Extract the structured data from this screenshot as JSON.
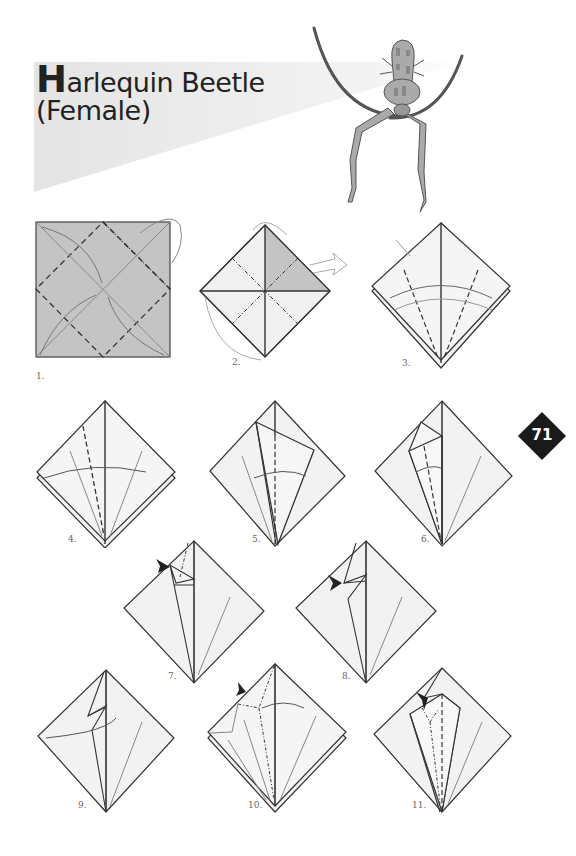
{
  "page": {
    "title_initial": "H",
    "title_rest": "arlequin Beetle",
    "subtitle": "(Female)",
    "page_number": "71"
  },
  "steps": [
    {
      "number": "1.",
      "label": "1."
    },
    {
      "number": "2.",
      "label": "2."
    },
    {
      "number": "3.",
      "label": "3."
    },
    {
      "number": "4.",
      "label": "4."
    },
    {
      "number": "5.",
      "label": "5."
    },
    {
      "number": "6.",
      "label": "6."
    },
    {
      "number": "7.",
      "label": "7."
    },
    {
      "number": "8.",
      "label": "8."
    },
    {
      "number": "9.",
      "label": "9."
    },
    {
      "number": "10.",
      "label": "10."
    },
    {
      "number": "11.",
      "label": "11."
    }
  ],
  "colors": {
    "paper_colored": "#c4c4c4",
    "paper_white": "#f2f2f2",
    "line": "#333333",
    "banner": "#e6e6e6",
    "badge": "#1a1a1a"
  }
}
